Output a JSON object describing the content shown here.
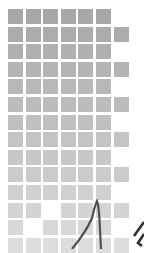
{
  "grid": {
    "columns": 7,
    "rows": 14,
    "cell_size": 15,
    "pitch": 17.6,
    "origin": [
      8,
      9
    ],
    "colors": {
      "top": "#a8a8a8",
      "bottom": "#dcdcdc"
    },
    "missing_cells": [
      [
        11,
        2
      ],
      [
        12,
        1
      ]
    ]
  },
  "curve": {
    "color": "#505050",
    "description": "dark curved line rising to a peak"
  },
  "glyph": {
    "color": "#303030",
    "description": "partial dark mark at lower right edge"
  }
}
